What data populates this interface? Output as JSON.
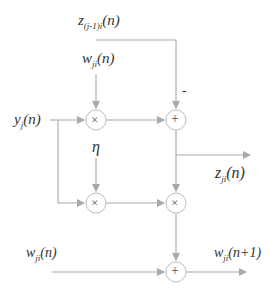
{
  "diagram": {
    "labels": {
      "z_prev": {
        "base": "z",
        "sub": "(j-1)i",
        "arg": "(n)"
      },
      "w_top": {
        "base": "w",
        "sub": "ji",
        "arg": "(n)"
      },
      "y_in": {
        "base": "y",
        "sub": "j",
        "arg": "(n)"
      },
      "eta": "η",
      "z_out": {
        "base": "z",
        "sub": "ji",
        "arg": "(n)"
      },
      "w_bottom": {
        "base": "w",
        "sub": "ji",
        "arg": "(n)"
      },
      "w_next": {
        "base": "w",
        "sub": "ji",
        "arg": "(n+1)"
      },
      "minus_sign": "-"
    },
    "nodes": [
      {
        "id": "mult1",
        "op": "×"
      },
      {
        "id": "sum1",
        "op": "+"
      },
      {
        "id": "mult2",
        "op": "×"
      },
      {
        "id": "mult3",
        "op": "×"
      },
      {
        "id": "sum2",
        "op": "+"
      }
    ],
    "colors": {
      "line": "#a8a8a8",
      "text": "#333333",
      "node_border": "#bdbdbd"
    }
  }
}
